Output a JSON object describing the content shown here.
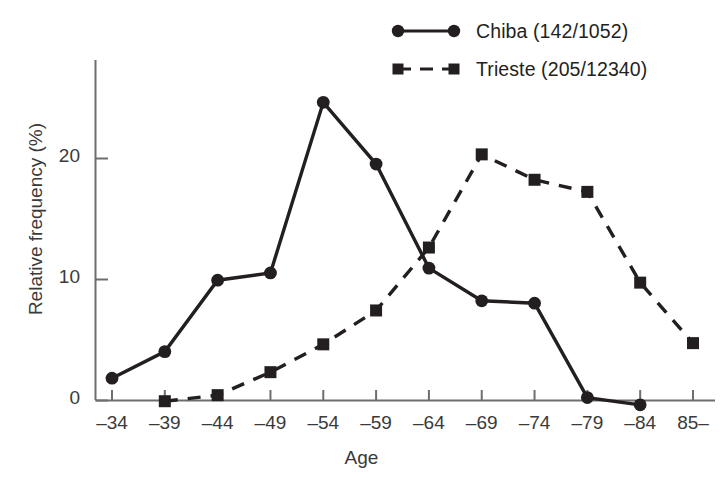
{
  "chart_data": {
    "type": "line",
    "title": "",
    "xlabel": "Age",
    "ylabel": "Relative frequency (%)",
    "categories": [
      "–34",
      "–39",
      "–44",
      "–49",
      "–54",
      "–59",
      "–64",
      "–69",
      "–74",
      "–79",
      "–84",
      "85–"
    ],
    "ylim": [
      -1.5,
      27
    ],
    "yticks": [
      0,
      10,
      20
    ],
    "ytick_labels": [
      "0",
      "10",
      "20"
    ],
    "grid": false,
    "legend_position": "top-right",
    "series": [
      {
        "name": "Chiba (142/1052)",
        "marker": "circle",
        "line_style": "solid",
        "color": "#231f20",
        "values": [
          1.8,
          4.0,
          9.9,
          10.5,
          24.6,
          19.5,
          10.9,
          8.2,
          8.0,
          0.2,
          -0.4,
          null
        ]
      },
      {
        "name": "Trieste (205/12340)",
        "marker": "square",
        "line_style": "dashed",
        "color": "#231f20",
        "values": [
          null,
          -0.1,
          0.4,
          2.3,
          4.6,
          7.4,
          12.6,
          20.3,
          18.2,
          17.2,
          9.7,
          4.7
        ]
      }
    ]
  },
  "legend": {
    "entries": [
      {
        "label": "Chiba (142/1052)",
        "marker": "circle-solid-line"
      },
      {
        "label": "Trieste (205/12340)",
        "marker": "square-dashed-line"
      }
    ]
  },
  "axes": {
    "x_title": "Age",
    "y_title": "Relative frequency (%)"
  }
}
